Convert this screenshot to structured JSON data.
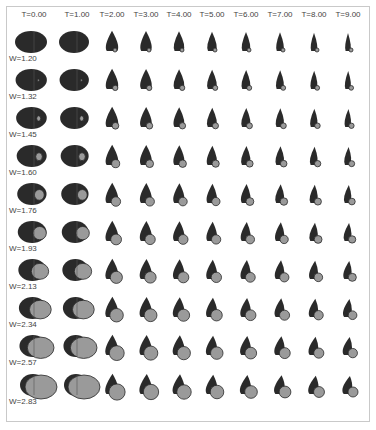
{
  "figure": {
    "columns": [
      {
        "label": "T=0.00",
        "x": 34
      },
      {
        "label": "T=1.00",
        "x": 77
      },
      {
        "label": "T=2.00",
        "x": 112
      },
      {
        "label": "T=3.00",
        "x": 146
      },
      {
        "label": "T=4.00",
        "x": 179
      },
      {
        "label": "T=5.00",
        "x": 212
      },
      {
        "label": "T=6.00",
        "x": 246
      },
      {
        "label": "T=7.00",
        "x": 280
      },
      {
        "label": "T=8.00",
        "x": 314
      },
      {
        "label": "T=9.00",
        "x": 348
      }
    ],
    "rows": [
      {
        "label": "W=1.20",
        "y": 42
      },
      {
        "label": "W=1.32",
        "y": 80
      },
      {
        "label": "W=1.45",
        "y": 118
      },
      {
        "label": "W=1.60",
        "y": 156
      },
      {
        "label": "W=1.76",
        "y": 194
      },
      {
        "label": "W=1.93",
        "y": 232
      },
      {
        "label": "W=2.13",
        "y": 270
      },
      {
        "label": "W=2.34",
        "y": 308
      },
      {
        "label": "W=2.57",
        "y": 346
      },
      {
        "label": "W=2.83",
        "y": 385
      }
    ],
    "colors": {
      "dark": "#2a2a2a",
      "light": "#9a9a9a",
      "frame": "#c9c9c9",
      "text": "#444444"
    }
  }
}
